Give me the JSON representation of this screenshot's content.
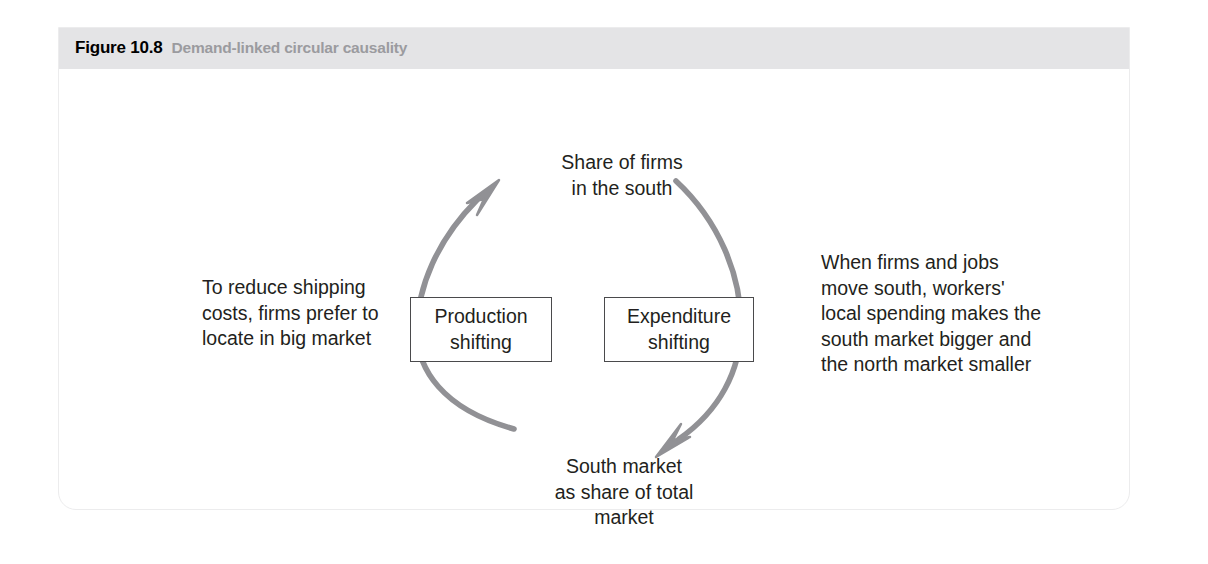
{
  "caption": {
    "number": "Figure 10.8",
    "title": "Demand-linked circular causality"
  },
  "diagram": {
    "type": "circular-causality-loop",
    "nodes": {
      "top": "Share of firms\nin the south",
      "bottom": "South market\nas share of total\nmarket"
    },
    "boxes": {
      "left": "Production\nshifting",
      "right": "Expenditure\nshifting"
    },
    "annotations": {
      "left": "To reduce shipping\ncosts, firms prefer to\nlocate in big market",
      "right": "When firms and jobs\nmove south, workers'\nlocal spending makes the\nsouth market bigger and\nthe north market smaller"
    },
    "arrows": {
      "left": "curved-arrow-up",
      "right": "curved-arrow-down"
    },
    "colors": {
      "arrow": "#919195",
      "caption_bar": "#e4e4e6",
      "caption_title": "#9b9b9f",
      "text": "#231f20",
      "box_border": "#4a4a4c"
    }
  }
}
